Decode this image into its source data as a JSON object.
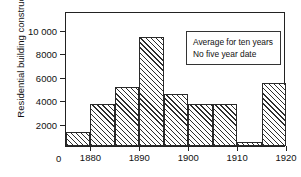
{
  "chart_data": {
    "type": "bar",
    "title": "",
    "xlabel": "",
    "ylabel": "Residential building construction",
    "xlim": [
      1875,
      1920
    ],
    "ylim": [
      0,
      11500
    ],
    "grid": false,
    "legend": null,
    "bin_width": 5,
    "categories": [
      "1875-1880",
      "1880-1885",
      "1885-1890",
      "1890-1895",
      "1895-1900",
      "1900-1905",
      "1905-1910",
      "1910-1915",
      "1915-1920"
    ],
    "bins": [
      {
        "start": 1875,
        "end": 1880,
        "value": 1200
      },
      {
        "start": 1880,
        "end": 1885,
        "value": 3550
      },
      {
        "start": 1885,
        "end": 1890,
        "value": 5000
      },
      {
        "start": 1890,
        "end": 1895,
        "value": 9300
      },
      {
        "start": 1895,
        "end": 1900,
        "value": 4400
      },
      {
        "start": 1900,
        "end": 1905,
        "value": 3550
      },
      {
        "start": 1905,
        "end": 1910,
        "value": 3550
      },
      {
        "start": 1910,
        "end": 1915,
        "value": 300
      },
      {
        "start": 1915,
        "end": 1920,
        "value": 5350
      }
    ],
    "values": [
      1200,
      3550,
      5000,
      9300,
      4400,
      3550,
      3550,
      300,
      5350
    ],
    "xticks": [
      {
        "value": 1880,
        "label": "1880"
      },
      {
        "value": 1890,
        "label": "1890"
      },
      {
        "value": 1900,
        "label": "1900"
      },
      {
        "value": 1910,
        "label": "1910"
      },
      {
        "value": 1920,
        "label": "1920"
      }
    ],
    "origin_label": "0",
    "yticks": [
      {
        "value": 2000,
        "label": "2000"
      },
      {
        "value": 4000,
        "label": "4000"
      },
      {
        "value": 6000,
        "label": "6000"
      },
      {
        "value": 8000,
        "label": "8000"
      },
      {
        "value": 10000,
        "label": "10 000"
      }
    ],
    "annotations": [
      {
        "lines": [
          "Average for ten years",
          "No five year date"
        ]
      }
    ],
    "colors": {
      "axis": "#222222",
      "bar_edge": "#2a2a2a",
      "bar_hatch": "#2e2e2e",
      "background": "#ffffff",
      "text": "#111111"
    }
  },
  "annotation": {
    "line1": "Average for ten years",
    "line2": "No five year date"
  }
}
